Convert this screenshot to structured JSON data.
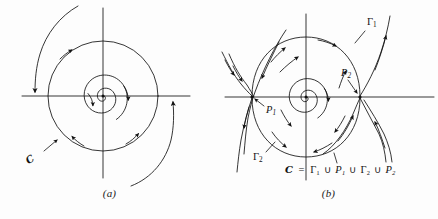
{
  "figure": {
    "background_color": "#fdfdfd",
    "ink_color": "#121212",
    "panels": [
      {
        "id": "a",
        "caption": "(a)",
        "center": [
          103,
          96
        ],
        "description": "phase portrait with limit cycle, inner spiral winding outward and outer spiral winding inward",
        "labels": [
          {
            "name": "curve-label-c",
            "text": "ℎ",
            "display": "C",
            "x": 33,
            "y": 158
          }
        ],
        "limit_cycle_radius": 55,
        "axes": {
          "x_from": 22,
          "x_to": 190,
          "y_from": 8,
          "y_to": 178
        }
      },
      {
        "id": "b",
        "caption": "(b)",
        "center": [
          87,
          97
        ],
        "description": "phase portrait with a closed curve formed by two arcs and two saddle points",
        "labels": [
          {
            "name": "gamma-1-label",
            "text": "Γ",
            "sub": "1",
            "x": 148,
            "y": 22
          },
          {
            "name": "gamma-2-label",
            "text": "Γ",
            "sub": "2",
            "x": 36,
            "y": 158
          },
          {
            "name": "p-1-label",
            "text": "P",
            "sub": "1",
            "x": 46,
            "y": 108
          },
          {
            "name": "p-2-label",
            "text": "P",
            "sub": "2",
            "x": 127,
            "y": 72
          }
        ],
        "equation": {
          "name": "set-union-equation",
          "lhs": "C",
          "eq": "=",
          "terms": [
            "Γ₁",
            "P₁",
            "Γ₂",
            "P₂"
          ],
          "operator": "∪",
          "full_text": "C = Γ₁ ∪ P₁ ∪ Γ₂ ∪ P₂",
          "x": 70,
          "y": 167
        },
        "axes": {
          "x_from": 6,
          "x_to": 215,
          "y_from": 14,
          "y_to": 180
        }
      }
    ]
  }
}
